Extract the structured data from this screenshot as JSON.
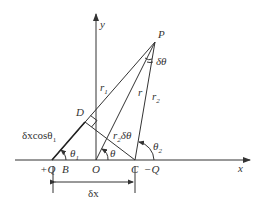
{
  "diagram": {
    "type": "geometry",
    "axes": {
      "x_label": "x",
      "y_label": "y"
    },
    "points": {
      "P": "P",
      "D": "D",
      "B": "B",
      "O": "O",
      "C": "C",
      "plusQ": "+Q",
      "minusQ": "−Q"
    },
    "segments": {
      "r1": "r",
      "r1_sub": "1",
      "r": "r",
      "r2": "r",
      "r2_sub": "2",
      "r2dtheta_r": "r",
      "r2dtheta_sub": "2",
      "r2dtheta_tail": "δθ"
    },
    "angles": {
      "delta_theta": "δθ",
      "theta": "θ",
      "theta1": "θ",
      "theta1_sub": "1",
      "theta2": "θ",
      "theta2_sub": "2"
    },
    "annotations": {
      "dxcos": "δxcosθ",
      "dxcos_sub": "1",
      "dx": "δx"
    }
  }
}
